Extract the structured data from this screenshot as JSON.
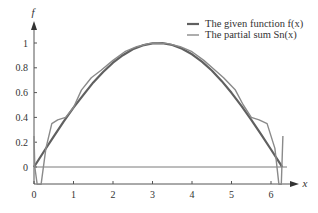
{
  "chart_data": {
    "type": "line",
    "title": "",
    "xlabel": "x",
    "ylabel": "f",
    "xlim": [
      0,
      6.5
    ],
    "ylim": [
      -0.14,
      1.1
    ],
    "grid": false,
    "legend_position": "top-right",
    "x_ticks": [
      "0",
      "1",
      "2",
      "3",
      "4",
      "5",
      "6"
    ],
    "y_ticks": [
      "0",
      "0.2",
      "0.4",
      "0.6",
      "0.8",
      "1"
    ],
    "legend": [
      {
        "label": "The given function f(x)",
        "color": "#606060",
        "width": 2.2
      },
      {
        "label": "The partial sum Sn(x)",
        "color": "#8a8a8a",
        "width": 1.4
      }
    ],
    "series": [
      {
        "name": "The given function f(x)",
        "x": [
          0,
          0.25,
          0.5,
          0.75,
          1,
          1.25,
          1.5,
          1.75,
          2,
          2.25,
          2.5,
          2.75,
          3,
          3.25,
          3.5,
          3.75,
          4,
          4.25,
          4.5,
          4.75,
          5,
          5.25,
          5.5,
          5.75,
          6,
          6.25,
          6.28
        ],
        "y": [
          0,
          0.125,
          0.247,
          0.366,
          0.479,
          0.582,
          0.682,
          0.766,
          0.841,
          0.902,
          0.949,
          0.981,
          0.997,
          0.999,
          0.984,
          0.954,
          0.909,
          0.85,
          0.778,
          0.694,
          0.598,
          0.493,
          0.381,
          0.263,
          0.141,
          0.017,
          0
        ]
      },
      {
        "name": "The partial sum Sn(x)",
        "x": [
          0,
          0.02,
          0.08,
          0.18,
          0.3,
          0.45,
          0.6,
          0.8,
          1.0,
          1.2,
          1.45,
          1.7,
          2.0,
          2.3,
          2.6,
          2.9,
          3.14,
          3.4,
          3.7,
          4.0,
          4.3,
          4.55,
          4.8,
          5.1,
          5.3,
          5.5,
          5.7,
          5.9,
          6.1,
          6.2,
          6.26,
          6.3
        ],
        "y": [
          0.25,
          0.0,
          -0.14,
          -0.14,
          0.15,
          0.35,
          0.38,
          0.4,
          0.48,
          0.62,
          0.72,
          0.78,
          0.86,
          0.93,
          0.97,
          0.995,
          1.0,
          0.995,
          0.97,
          0.93,
          0.86,
          0.79,
          0.72,
          0.62,
          0.5,
          0.4,
          0.38,
          0.35,
          0.15,
          -0.14,
          -0.14,
          0.25
        ]
      }
    ]
  }
}
